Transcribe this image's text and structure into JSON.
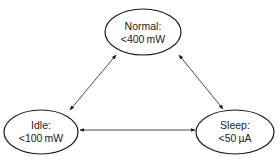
{
  "diagram": {
    "type": "state-diagram",
    "nodes": [
      {
        "id": "normal",
        "title": "Normal:",
        "value": "<400 mW"
      },
      {
        "id": "idle",
        "title": "Idle:",
        "value": "<100 mW"
      },
      {
        "id": "sleep",
        "title": "Sleep:",
        "value": "<50 µA"
      }
    ],
    "edges": [
      {
        "from": "normal",
        "to": "idle",
        "bidirectional": true
      },
      {
        "from": "normal",
        "to": "sleep",
        "bidirectional": true
      },
      {
        "from": "idle",
        "to": "sleep",
        "bidirectional": true
      }
    ],
    "colors": {
      "stroke": "#1a1a1a",
      "text": "#222222",
      "background": "#ffffff"
    }
  }
}
